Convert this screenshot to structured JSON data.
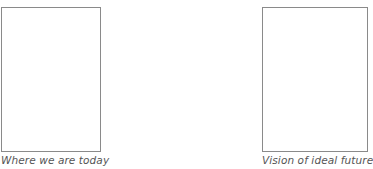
{
  "diagram": {
    "type": "comparison",
    "colors": {
      "background": "#ffffff",
      "frame_border": "#8a8a8a",
      "caption_text": "#555555"
    },
    "panels": [
      {
        "id": "today",
        "caption": "Where we are today"
      },
      {
        "id": "future",
        "caption": "Vision of ideal future"
      }
    ]
  }
}
